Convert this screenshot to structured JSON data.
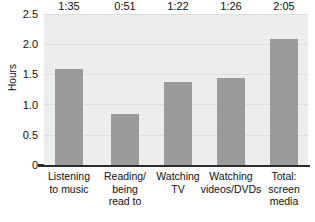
{
  "chart_data": {
    "type": "bar",
    "title": "",
    "xlabel": "",
    "ylabel": "Hours",
    "ylim": [
      0,
      2.5
    ],
    "ytick_labels": [
      "2.5",
      "2.0",
      "1.5",
      "1.0",
      "0.5",
      "0"
    ],
    "ytick_values": [
      2.5,
      2.0,
      1.5,
      1.0,
      0.5,
      0
    ],
    "grid": true,
    "legend": "none",
    "categories": [
      "Listening to music",
      "Reading/ being read to",
      "Watching TV",
      "Watching videos/DVDs",
      "Total: screen media"
    ],
    "category_lines": [
      [
        "Listening",
        "to music"
      ],
      [
        "Reading/",
        "being",
        "read to"
      ],
      [
        "Watching",
        "TV"
      ],
      [
        "Watching",
        "videos/DVDs"
      ],
      [
        "Total:",
        "screen",
        "media"
      ]
    ],
    "data_labels": [
      "1:35",
      "0:51",
      "1:22",
      "1:26",
      "2:05"
    ],
    "values": [
      1.583,
      0.85,
      1.367,
      1.433,
      2.083
    ],
    "bar_color": "#9a9b9a",
    "plot_background": "#eceded",
    "gridline_color": "#dcdddd",
    "axis_color": "#2b2b2b",
    "text_color": "#111111"
  }
}
